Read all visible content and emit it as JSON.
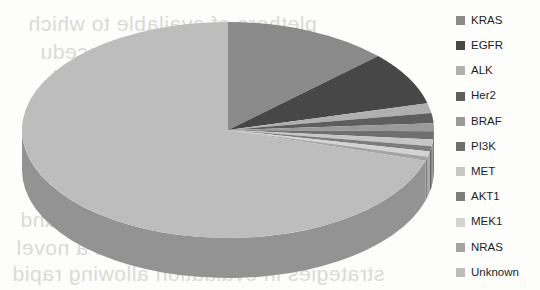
{
  "chart_data": {
    "type": "pie",
    "title": "",
    "subtitle": "",
    "xlabel": "",
    "ylabel": "",
    "legend_position": "right",
    "three_d": true,
    "start_angle_deg": 0,
    "direction": "clockwise",
    "grid": false,
    "categories": [
      "KRAS",
      "EGFR",
      "ALK",
      "Her2",
      "BRAF",
      "PI3K",
      "MET",
      "AKT1",
      "MEK1",
      "NRAS",
      "Unknown"
    ],
    "values": [
      13,
      8,
      1.5,
      1.5,
      1.2,
      1.2,
      1,
      0.8,
      0.8,
      0.6,
      70.4
    ],
    "colors": [
      "#8a8a8a",
      "#474747",
      "#b0b0b0",
      "#5e5e5e",
      "#9a9a9a",
      "#6f6f6f",
      "#c6c6c6",
      "#7d7d7d",
      "#d3d3d3",
      "#a4a4a4",
      "#bdbdbd"
    ],
    "slices": [
      {
        "label": "KRAS",
        "value": 13,
        "color": "#8a8a8a",
        "swatch": "#8a8a8a"
      },
      {
        "label": "EGFR",
        "value": 8,
        "color": "#474747",
        "swatch": "#474747"
      },
      {
        "label": "ALK",
        "value": 1.5,
        "color": "#b0b0b0",
        "swatch": "#b0b0b0"
      },
      {
        "label": "Her2",
        "value": 1.5,
        "color": "#5e5e5e",
        "swatch": "#5e5e5e"
      },
      {
        "label": "BRAF",
        "value": 1.2,
        "color": "#9a9a9a",
        "swatch": "#9a9a9a"
      },
      {
        "label": "PI3K",
        "value": 1.2,
        "color": "#6f6f6f",
        "swatch": "#6f6f6f"
      },
      {
        "label": "MET",
        "value": 1,
        "color": "#c6c6c6",
        "swatch": "#c6c6c6"
      },
      {
        "label": "AKT1",
        "value": 0.8,
        "color": "#7d7d7d",
        "swatch": "#7d7d7d"
      },
      {
        "label": "MEK1",
        "value": 0.8,
        "color": "#d3d3d3",
        "swatch": "#d3d3d3"
      },
      {
        "label": "NRAS",
        "value": 0.6,
        "color": "#a4a4a4",
        "swatch": "#a4a4a4"
      },
      {
        "label": "Unknown",
        "value": 70.4,
        "color": "#bdbdbd",
        "swatch": "#bdbdbd"
      }
    ]
  },
  "legend": {
    "items": [
      {
        "label": "KRAS"
      },
      {
        "label": "EGFR"
      },
      {
        "label": "ALK"
      },
      {
        "label": "Her2"
      },
      {
        "label": "BRAF"
      },
      {
        "label": "PI3K"
      },
      {
        "label": "MET"
      },
      {
        "label": "AKT1"
      },
      {
        "label": "MEK1"
      },
      {
        "label": "NRAS"
      },
      {
        "label": "Unknown"
      }
    ]
  },
  "background_text": {
    "lines": [
      "plethora of available to which",
      "tion of analyses procedu",
      "tools and",
      "sed and",
      "excellent ty with a novel",
      "strategies in evaluation allowing rapid"
    ]
  }
}
